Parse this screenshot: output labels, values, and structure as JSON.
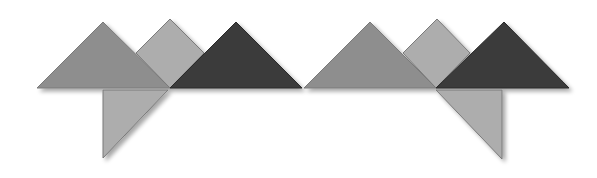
{
  "image": {
    "description": "Two tangram-style figures of grey triangles and squares on a white background",
    "colors": {
      "background": "#ffffff",
      "mid_grey": "#8e8e8e",
      "light_grey": "#adadad",
      "dark_grey": "#3a3a3a",
      "edge_dark": "#2a2a2a",
      "shadow": "#d4d4d4"
    },
    "figures": [
      {
        "name": "left-figure",
        "pieces": [
          {
            "name": "large-triangle-left",
            "shade": "mid_grey",
            "points": "37,88 103,22 170,88"
          },
          {
            "name": "square-middle",
            "shade": "light_grey",
            "points": "170,19 204,53 170,88 136,53"
          },
          {
            "name": "large-triangle-dark",
            "shade": "dark_grey",
            "points": "170,88 236,22 302,88"
          },
          {
            "name": "bottom-triangle",
            "shade": "light_grey",
            "points": "103,90 168,90 103,158"
          }
        ]
      },
      {
        "name": "right-figure",
        "pieces": [
          {
            "name": "large-triangle-left",
            "shade": "mid_grey",
            "points": "304,88 370,22 436,88"
          },
          {
            "name": "square-middle",
            "shade": "light_grey",
            "points": "437,19 470,53 436,88 403,53"
          },
          {
            "name": "large-triangle-dark",
            "shade": "dark_grey",
            "points": "436,88 504,22 569,88"
          },
          {
            "name": "bottom-triangle",
            "shade": "light_grey",
            "points": "436,90 502,90 502,159"
          }
        ]
      }
    ]
  }
}
